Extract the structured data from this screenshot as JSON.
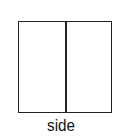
{
  "diagram": {
    "label": "side",
    "shape": "rectangle divided vertically into two equal halves",
    "stroke_color": "#222222"
  }
}
